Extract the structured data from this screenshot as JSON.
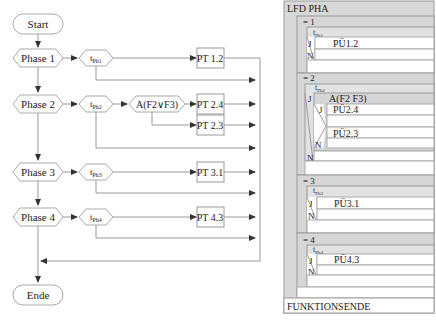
{
  "flowchart": {
    "start_label": "Start",
    "end_label": "Ende",
    "phases": [
      {
        "label": "Phase 1",
        "timer": "t",
        "timer_sub": "Ph1",
        "outputs": [
          "PT 1.2"
        ]
      },
      {
        "label": "Phase 2",
        "timer": "t",
        "timer_sub": "Ph2",
        "condition": "A(F2∨F3)",
        "outputs": [
          "PT 2.4",
          "PT 2.3"
        ]
      },
      {
        "label": "Phase 3",
        "timer": "t",
        "timer_sub": "Ph3",
        "outputs": [
          "PT 3.1"
        ]
      },
      {
        "label": "Phase 4",
        "timer": "t",
        "timer_sub": "Ph4",
        "outputs": [
          "PT 4.3"
        ]
      }
    ]
  },
  "structogram": {
    "title": "LFD PHA",
    "footer": "FUNKTIONSENDE",
    "yes": "J",
    "no": "N",
    "cases": [
      {
        "label": "= 1",
        "timer": "t",
        "timer_sub": "Ph1",
        "action": "PÜ1.2"
      },
      {
        "label": "= 2",
        "timer": "t",
        "timer_sub": "Ph2",
        "condition": "A(F2 F3)",
        "action_yes": "PÜ2.4",
        "action_no": "PÜ2.3"
      },
      {
        "label": "= 3",
        "timer": "t",
        "timer_sub": "Ph3",
        "action": "PÜ3.1"
      },
      {
        "label": "= 4",
        "timer": "t",
        "timer_sub": "Ph4",
        "action": "PÜ4.3"
      }
    ]
  }
}
